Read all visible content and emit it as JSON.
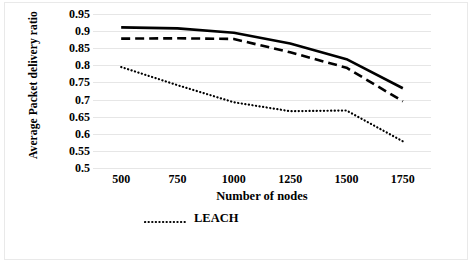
{
  "chart_data": {
    "type": "line",
    "title": "",
    "xlabel": "Number of nodes",
    "ylabel": "Average Packet delivery ratio",
    "categories": [
      "500",
      "750",
      "1000",
      "1250",
      "1500",
      "1750"
    ],
    "x": [
      500,
      750,
      1000,
      1250,
      1500,
      1750
    ],
    "ylim": [
      0.5,
      0.95
    ],
    "ytick_labels": [
      "0.95",
      "0.9",
      "0.85",
      "0.8",
      "0.75",
      "0.7",
      "0.65",
      "0.6",
      "0.55",
      "0.5"
    ],
    "ytick_values": [
      0.95,
      0.9,
      0.85,
      0.8,
      0.75,
      0.7,
      0.65,
      0.6,
      0.55,
      0.5
    ],
    "grid": true,
    "grid_axis": "y",
    "legend_position": "bottom-left",
    "series": [
      {
        "name": "solid-series",
        "label": "",
        "style": "solid",
        "color": "#000000",
        "width": 2.6,
        "values": [
          0.911,
          0.908,
          0.895,
          0.864,
          0.818,
          0.733
        ]
      },
      {
        "name": "dashed-series",
        "label": "",
        "style": "dashed",
        "color": "#000000",
        "width": 2.6,
        "values": [
          0.878,
          0.879,
          0.877,
          0.838,
          0.793,
          0.695
        ]
      },
      {
        "name": "leach-series",
        "label": "LEACH",
        "style": "dotted",
        "color": "#000000",
        "width": 2.2,
        "values": [
          0.795,
          0.742,
          0.692,
          0.666,
          0.668,
          0.578
        ]
      }
    ]
  },
  "legend": {
    "entries": [
      {
        "label": "LEACH",
        "style": "dotted",
        "color": "#000000"
      }
    ]
  },
  "axes": {
    "y_title": "Average Packet delivery ratio",
    "x_title": "Number of nodes"
  },
  "colors": {
    "line": "#000000",
    "grid": "#e6e6e6",
    "background": "#ffffff",
    "frame": "#e9e9e9"
  }
}
